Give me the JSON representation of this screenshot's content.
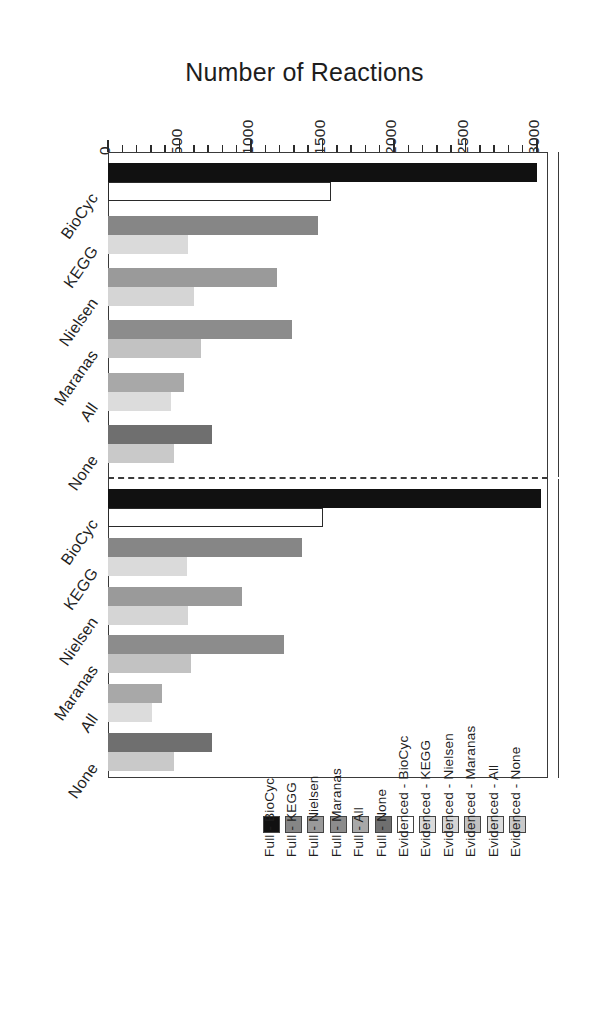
{
  "figure": {
    "axis_title": "Number of Reactions",
    "orientation": "rotated-90",
    "panels": [
      {
        "name": "Arabidopsis",
        "label": "Arabidopsis"
      },
      {
        "name": "Maize",
        "label": "Maize"
      }
    ]
  },
  "axis": {
    "tick_labels": [
      "0",
      "500",
      "1000",
      "1500",
      "2000",
      "2500",
      "3000"
    ],
    "tick_values": [
      0,
      500,
      1000,
      1500,
      2000,
      2500,
      3000
    ],
    "minor_step": 100,
    "min": 0,
    "max": 3000
  },
  "categories": [
    "BioCyc",
    "KEGG",
    "Nielsen",
    "Maranas",
    "All",
    "None"
  ],
  "legend": {
    "entries": [
      {
        "label": "Evidenced - None",
        "color": "#c9c9c9"
      },
      {
        "label": "Evidenced - All",
        "color": "#dcdcdc"
      },
      {
        "label": "Evidenced - Maranas",
        "color": "#c2c2c2"
      },
      {
        "label": "Evidenced - Nielsen",
        "color": "#d5d5d5"
      },
      {
        "label": "Evidenced - KEGG",
        "color": "#dadada"
      },
      {
        "label": "Evidenced - BioCyc",
        "color": "#ffffff"
      },
      {
        "label": "Full - None",
        "color": "#6f6f6f"
      },
      {
        "label": "Full - All",
        "color": "#a8a8a8"
      },
      {
        "label": "Full - Maranas",
        "color": "#8c8c8c"
      },
      {
        "label": "Full - Nielsen",
        "color": "#9a9a9a"
      },
      {
        "label": "Full - KEGG",
        "color": "#868686"
      },
      {
        "label": "Full - BioCyc",
        "color": "#111111"
      }
    ]
  },
  "chart_data": {
    "type": "bar",
    "title": "Number of Reactions",
    "xlabel": "Number of Reactions",
    "ylabel": "",
    "xlim": [
      0,
      3000
    ],
    "grid": false,
    "legend_position": "bottom",
    "orientation": "horizontal",
    "categories": [
      "BioCyc",
      "KEGG",
      "Nielsen",
      "Maranas",
      "All",
      "None"
    ],
    "panels": [
      {
        "name": "Arabidopsis",
        "series": [
          {
            "name": "Full",
            "values": [
              3000,
              1470,
              1180,
              1290,
              530,
              730
            ]
          },
          {
            "name": "Evidenced",
            "values": [
              1560,
              560,
              600,
              650,
              440,
              460
            ]
          }
        ]
      },
      {
        "name": "Maize",
        "series": [
          {
            "name": "Full",
            "values": [
              3030,
              1360,
              940,
              1230,
              380,
              730
            ]
          },
          {
            "name": "Evidenced",
            "values": [
              1500,
              550,
              560,
              580,
              310,
              460
            ]
          }
        ]
      }
    ],
    "bar_colors": {
      "Arabidopsis": {
        "Full": [
          "#111111",
          "#868686",
          "#9a9a9a",
          "#8c8c8c",
          "#a8a8a8",
          "#6f6f6f"
        ],
        "Evidenced": [
          "#ffffff",
          "#dadada",
          "#d5d5d5",
          "#c2c2c2",
          "#dcdcdc",
          "#c9c9c9"
        ]
      },
      "Maize": {
        "Full": [
          "#111111",
          "#868686",
          "#9a9a9a",
          "#8c8c8c",
          "#a8a8a8",
          "#6f6f6f"
        ],
        "Evidenced": [
          "#ffffff",
          "#dadada",
          "#d5d5d5",
          "#c2c2c2",
          "#dcdcdc",
          "#c9c9c9"
        ]
      }
    }
  }
}
